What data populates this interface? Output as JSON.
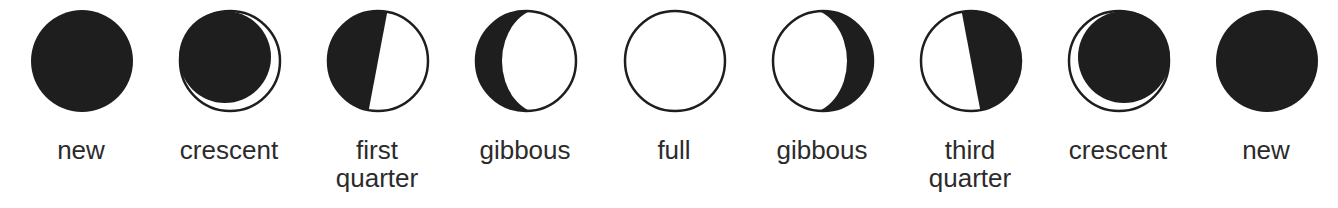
{
  "diagram": {
    "dark_color": "#1e1e1e",
    "light_color": "#ffffff",
    "phases": [
      {
        "label_line1": "new",
        "label_line2": "",
        "shape": "new"
      },
      {
        "label_line1": "crescent",
        "label_line2": "",
        "shape": "waxing-crescent"
      },
      {
        "label_line1": "first",
        "label_line2": "quarter",
        "shape": "first-quarter"
      },
      {
        "label_line1": "gibbous",
        "label_line2": "",
        "shape": "waxing-gibbous"
      },
      {
        "label_line1": "full",
        "label_line2": "",
        "shape": "full"
      },
      {
        "label_line1": "gibbous",
        "label_line2": "",
        "shape": "waning-gibbous"
      },
      {
        "label_line1": "third",
        "label_line2": "quarter",
        "shape": "third-quarter"
      },
      {
        "label_line1": "crescent",
        "label_line2": "",
        "shape": "waning-crescent"
      },
      {
        "label_line1": "new",
        "label_line2": "",
        "shape": "new"
      }
    ]
  }
}
